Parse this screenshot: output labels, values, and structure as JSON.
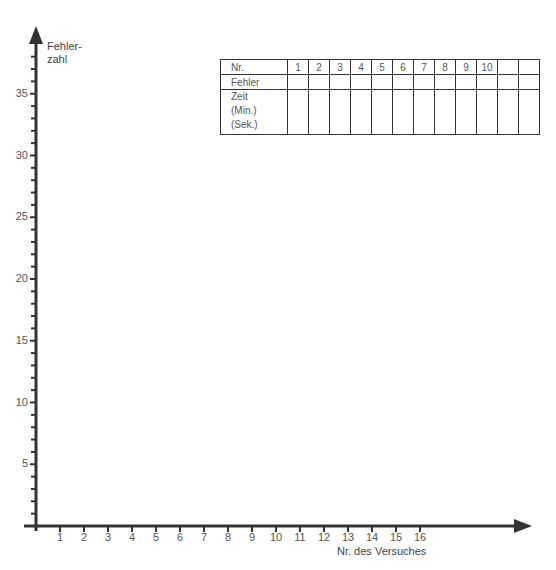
{
  "chart_data": {
    "type": "line",
    "title": "",
    "ylabel": "Fehler-\nzahl",
    "ylabel_lines": [
      "Fehler-",
      "zahl"
    ],
    "xlabel": "Nr. des Versuches",
    "x_ticks": [
      "1",
      "2",
      "3",
      "4",
      "5",
      "6",
      "7",
      "8",
      "9",
      "10",
      "11",
      "12",
      "13",
      "14",
      "15",
      "16"
    ],
    "y_ticks": [
      "5",
      "10",
      "15",
      "20",
      "25",
      "30",
      "35"
    ],
    "y_minor_step": 1,
    "ylim": [
      0,
      38
    ],
    "xlim": [
      0,
      20
    ],
    "grid": false,
    "series": [],
    "table": {
      "rows": [
        {
          "label": "Nr.",
          "cells": [
            "1",
            "2",
            "3",
            "4",
            "5",
            "6",
            "7",
            "8",
            "9",
            "10",
            "",
            ""
          ]
        },
        {
          "label": "Fehler",
          "cells": [
            "",
            "",
            "",
            "",
            "",
            "",
            "",
            "",
            "",
            "",
            "",
            ""
          ]
        },
        {
          "label_lines": [
            "Zeit",
            "(Min.)",
            "(Sek.)"
          ],
          "cells": [
            "",
            "",
            "",
            "",
            "",
            "",
            "",
            "",
            "",
            "",
            "",
            ""
          ]
        }
      ]
    }
  }
}
